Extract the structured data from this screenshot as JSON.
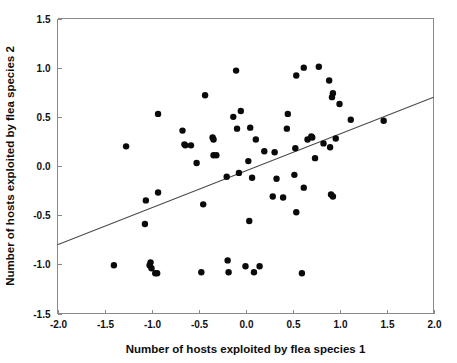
{
  "figure": {
    "background_color": "#ffffff",
    "point_color": "#0a0a0a",
    "line_color": "#4a4a4a",
    "axis_color": "#8a8a8a"
  },
  "chart_data": {
    "type": "scatter",
    "title": "",
    "xlabel": "Number of hosts exploited by flea species 1",
    "ylabel": "Number of hosts exploited by flea species 2",
    "xlim": [
      -2.0,
      2.0
    ],
    "ylim": [
      -1.5,
      1.5
    ],
    "xticks": [
      -2.0,
      -1.5,
      -1.0,
      -0.5,
      0.0,
      0.5,
      1.0,
      1.5,
      2.0
    ],
    "yticks": [
      -1.5,
      -1.0,
      -0.5,
      0.0,
      0.5,
      1.0,
      1.5
    ],
    "xticklabels": [
      "-2.0",
      "-1.5",
      "-1.0",
      "-0.5",
      "0.0",
      "0.5",
      "1.0",
      "1.5",
      "2.0"
    ],
    "yticklabels": [
      "-1.5",
      "-1.0",
      "-0.5",
      "0.0",
      "0.5",
      "1.0",
      "1.5"
    ],
    "grid": false,
    "legend": null,
    "marker": "circle",
    "marker_size": 4.2,
    "trendline": {
      "type": "linear",
      "x": [
        -2.0,
        2.0
      ],
      "y": [
        -0.8,
        0.7
      ],
      "slope": 0.375,
      "intercept": -0.05
    },
    "points": [
      [
        -1.4,
        -1.01
      ],
      [
        -1.27,
        0.2
      ],
      [
        -1.07,
        -0.59
      ],
      [
        -1.06,
        -0.35
      ],
      [
        -1.02,
        -1.01
      ],
      [
        -1.01,
        -0.98
      ],
      [
        -1.0,
        -1.04
      ],
      [
        -0.96,
        -1.09
      ],
      [
        -0.94,
        -1.09
      ],
      [
        -0.93,
        0.53
      ],
      [
        -0.93,
        -0.27
      ],
      [
        -0.67,
        0.36
      ],
      [
        -0.65,
        0.22
      ],
      [
        -0.64,
        0.21
      ],
      [
        -0.58,
        0.21
      ],
      [
        -0.52,
        0.03
      ],
      [
        -0.47,
        -1.08
      ],
      [
        -0.45,
        -0.39
      ],
      [
        -0.43,
        0.72
      ],
      [
        -0.35,
        0.29
      ],
      [
        -0.34,
        0.27
      ],
      [
        -0.34,
        0.11
      ],
      [
        -0.31,
        0.11
      ],
      [
        -0.2,
        -0.11
      ],
      [
        -0.19,
        -0.96
      ],
      [
        -0.18,
        -1.08
      ],
      [
        -0.13,
        0.5
      ],
      [
        -0.1,
        0.97
      ],
      [
        -0.09,
        0.38
      ],
      [
        -0.07,
        -0.07
      ],
      [
        -0.05,
        0.56
      ],
      [
        0.0,
        -1.02
      ],
      [
        0.03,
        0.05
      ],
      [
        0.04,
        -0.56
      ],
      [
        0.05,
        0.39
      ],
      [
        0.07,
        -0.12
      ],
      [
        0.09,
        -1.08
      ],
      [
        0.11,
        0.27
      ],
      [
        0.15,
        -1.02
      ],
      [
        0.2,
        0.15
      ],
      [
        0.29,
        -0.31
      ],
      [
        0.31,
        0.14
      ],
      [
        0.33,
        -0.13
      ],
      [
        0.4,
        -0.32
      ],
      [
        0.44,
        0.38
      ],
      [
        0.45,
        0.53
      ],
      [
        0.52,
        -0.09
      ],
      [
        0.53,
        0.18
      ],
      [
        0.54,
        0.92
      ],
      [
        0.54,
        -0.47
      ],
      [
        0.6,
        -1.09
      ],
      [
        0.62,
        1.0
      ],
      [
        0.62,
        -0.22
      ],
      [
        0.66,
        0.27
      ],
      [
        0.7,
        0.3
      ],
      [
        0.71,
        0.29
      ],
      [
        0.74,
        0.08
      ],
      [
        0.78,
        1.01
      ],
      [
        0.83,
        0.23
      ],
      [
        0.89,
        0.87
      ],
      [
        0.9,
        0.19
      ],
      [
        0.91,
        -0.29
      ],
      [
        0.92,
        0.7
      ],
      [
        0.93,
        0.74
      ],
      [
        0.93,
        -0.31
      ],
      [
        0.96,
        0.28
      ],
      [
        1.0,
        0.63
      ],
      [
        1.12,
        0.47
      ],
      [
        1.47,
        0.46
      ]
    ]
  }
}
